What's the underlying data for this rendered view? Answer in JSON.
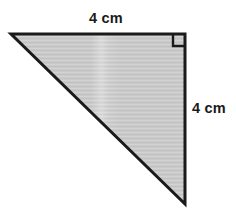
{
  "figure": {
    "type": "right-triangle-diagram",
    "background_color": "#ffffff",
    "stroke_color": "#1a1a1a",
    "fill_color": "#c8c8c8",
    "stroke_width": 3,
    "canvas": {
      "width": 236,
      "height": 221
    },
    "vertices": {
      "top_left": {
        "x": 11,
        "y": 34
      },
      "top_right": {
        "x": 185,
        "y": 34
      },
      "bottom_right": {
        "x": 185,
        "y": 204
      }
    },
    "right_angle_marker": {
      "name": "right-angle-square",
      "corner": "top-right",
      "size": 11,
      "visible": true
    }
  },
  "labels": {
    "top_edge": {
      "text": "4 cm",
      "value": 4,
      "unit": "cm",
      "edge": "top-leg"
    },
    "right_edge": {
      "text": "4 cm",
      "value": 4,
      "unit": "cm",
      "edge": "right-leg"
    }
  }
}
